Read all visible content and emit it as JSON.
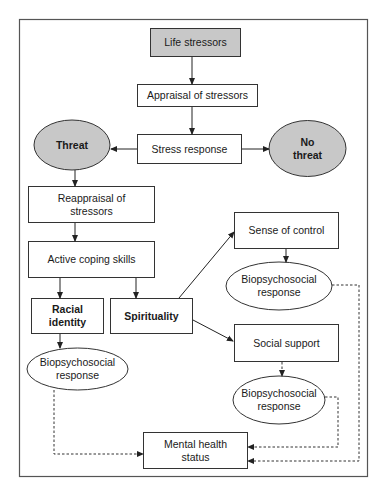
{
  "diagram": {
    "colors": {
      "shaded_fill": "#c8c8c8",
      "stroke": "#333333",
      "background": "#ffffff"
    },
    "nodes": {
      "life_stressors": "Life stressors",
      "appraisal": "Appraisal of stressors",
      "stress_response": "Stress response",
      "threat": "Threat",
      "no_threat_1": "No",
      "no_threat_2": "threat",
      "reappraisal_1": "Reappraisal of",
      "reappraisal_2": "stressors",
      "active_coping": "Active coping skills",
      "racial_identity_1": "Racial",
      "racial_identity_2": "identity",
      "spirituality": "Spirituality",
      "sense_of_control": "Sense of control",
      "biopsych_control_1": "Biopsychosocial",
      "biopsych_control_2": "response",
      "social_support": "Social support",
      "biopsych_support_1": "Biopsychosocial",
      "biopsych_support_2": "response",
      "biopsych_racial_1": "Biopsychosocial",
      "biopsych_racial_2": "response",
      "mental_health_1": "Mental health",
      "mental_health_2": "status"
    },
    "edges": [
      {
        "from": "Life stressors",
        "to": "Appraisal of stressors",
        "style": "solid"
      },
      {
        "from": "Appraisal of stressors",
        "to": "Stress response",
        "style": "solid"
      },
      {
        "from": "Stress response",
        "to": "Threat",
        "style": "solid"
      },
      {
        "from": "Stress response",
        "to": "No threat",
        "style": "solid"
      },
      {
        "from": "Threat",
        "to": "Reappraisal of stressors",
        "style": "solid"
      },
      {
        "from": "Reappraisal of stressors",
        "to": "Active coping skills",
        "style": "solid"
      },
      {
        "from": "Active coping skills",
        "to": "Racial identity",
        "style": "solid"
      },
      {
        "from": "Active coping skills",
        "to": "Spirituality",
        "style": "solid"
      },
      {
        "from": "Spirituality",
        "to": "Sense of control",
        "style": "solid"
      },
      {
        "from": "Spirituality",
        "to": "Social support",
        "style": "solid"
      },
      {
        "from": "Sense of control",
        "to": "Biopsychosocial response",
        "style": "solid"
      },
      {
        "from": "Social support",
        "to": "Biopsychosocial response",
        "style": "dashed"
      },
      {
        "from": "Racial identity",
        "to": "Biopsychosocial response",
        "style": "solid"
      },
      {
        "from": "Biopsychosocial response (racial)",
        "to": "Mental health status",
        "style": "dashed"
      },
      {
        "from": "Biopsychosocial response (support)",
        "to": "Mental health status",
        "style": "dashed"
      },
      {
        "from": "Biopsychosocial response (control)",
        "to": "Mental health status",
        "style": "dashed"
      }
    ]
  }
}
